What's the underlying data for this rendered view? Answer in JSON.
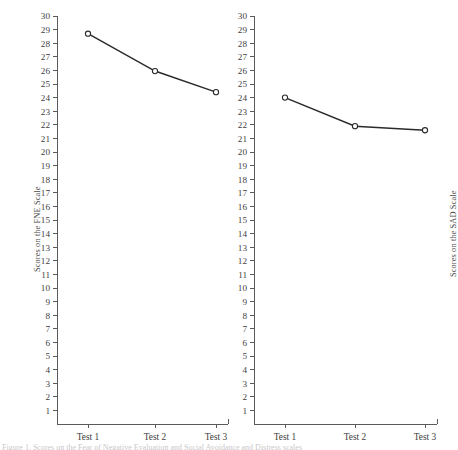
{
  "figure": {
    "background_color": "#ffffff",
    "ink_color": "#3a3a3a",
    "line_color": "#2b2b2b",
    "marker_fill": "#ffffff",
    "axis_color": "#5b5b5b",
    "caption_sliver_text": "Figure 1. Scores on the Fear of Negative Evaluation and Social Avoidance and Distress scales"
  },
  "chart_data": [
    {
      "type": "line",
      "id": "fne",
      "title": "",
      "xlabel": "",
      "ylabel": "Scores on the FNE Scale",
      "categories": [
        "Test 1",
        "Test 2",
        "Test 3"
      ],
      "values": [
        28.7,
        25.95,
        24.4
      ],
      "ylim": [
        0,
        30
      ],
      "yticks": [
        1,
        2,
        3,
        4,
        5,
        6,
        7,
        8,
        9,
        10,
        11,
        12,
        13,
        14,
        15,
        16,
        17,
        18,
        19,
        20,
        21,
        22,
        23,
        24,
        25,
        26,
        27,
        28,
        29,
        30
      ],
      "ytick_labels": [
        "1",
        "2",
        "3",
        "4",
        "5",
        "6",
        "7",
        "8",
        "9",
        "10",
        "11",
        "12",
        "13",
        "14",
        "15",
        "16",
        "17",
        "18",
        "19",
        "20",
        "21",
        "22",
        "23",
        "24",
        "25",
        "26",
        "27",
        "28",
        "29",
        "30"
      ],
      "grid": false,
      "legend": "none",
      "marker": "open-circle"
    },
    {
      "type": "line",
      "id": "sad",
      "title": "",
      "xlabel": "",
      "ylabel": "Scores on the SAD Scale",
      "categories": [
        "Test 1",
        "Test 2",
        "Test 3"
      ],
      "values": [
        24.0,
        21.9,
        21.6
      ],
      "ylim": [
        0,
        30
      ],
      "yticks": [
        1,
        2,
        3,
        4,
        5,
        6,
        7,
        8,
        9,
        10,
        11,
        12,
        13,
        14,
        15,
        16,
        17,
        18,
        19,
        20,
        21,
        22,
        23,
        24,
        25,
        26,
        27,
        28,
        29,
        30
      ],
      "ytick_labels": [
        "1",
        "2",
        "3",
        "4",
        "5",
        "6",
        "7",
        "8",
        "9",
        "10",
        "11",
        "12",
        "13",
        "14",
        "15",
        "16",
        "17",
        "18",
        "19",
        "20",
        "21",
        "22",
        "23",
        "24",
        "25",
        "26",
        "27",
        "28",
        "29",
        "30"
      ],
      "grid": false,
      "legend": "none",
      "marker": "open-circle"
    }
  ]
}
